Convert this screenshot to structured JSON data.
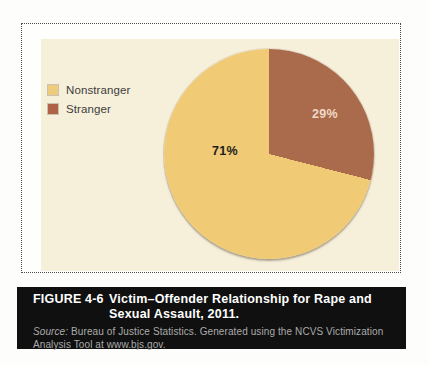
{
  "chart_data": {
    "type": "pie",
    "title": "Victim–Offender Relationship for Rape and Sexual Assault, 2011.",
    "slices": [
      {
        "label": "Nonstranger",
        "value": 71,
        "display_label": "71%",
        "color": "#F0CA74",
        "label_color": "#1e1e1e"
      },
      {
        "label": "Stranger",
        "value": 29,
        "display_label": "29%",
        "color": "#A96B4C",
        "label_color": "#EFD9C4"
      }
    ],
    "values_unit": "percent",
    "start_angle_deg": 0,
    "direction": "clockwise",
    "legend_position": "upper-left",
    "legend_swatch_colors": [
      "#EDCC7E",
      "#B06246"
    ]
  },
  "caption": {
    "figure_label": "FIGURE 4-6",
    "title_line1": "Victim–Offender Relationship for Rape and",
    "title_line2": "Sexual Assault, 2011.",
    "source_prefix": "Source:",
    "source_line1_rest": " Bureau of Justice Statistics. Generated using the NCVS Victimization",
    "source_line2": "Analysis Tool at www.bjs.gov."
  },
  "colors": {
    "panel_background": "#F6EFDA",
    "caption_background": "#101010",
    "caption_text": "#FFFFFF",
    "source_text": "#ABABAB"
  }
}
